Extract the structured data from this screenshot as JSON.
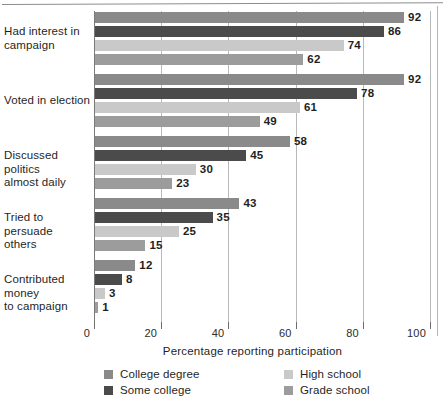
{
  "chart_data": {
    "type": "bar",
    "orientation": "horizontal",
    "title": "",
    "xlabel": "Percentage reporting participation",
    "ylabel": "",
    "xlim": [
      0,
      100
    ],
    "xticks": [
      0,
      20,
      40,
      60,
      80,
      100
    ],
    "xtick_labels": [
      "0",
      "20",
      "40",
      "60",
      "80",
      "100"
    ],
    "grid": true,
    "legend_position": "bottom",
    "categories": [
      "Had interest in campaign",
      "Voted in election",
      "Discussed politics almost daily",
      "Tried to persuade others",
      "Contributed money to campaign"
    ],
    "category_lines": [
      [
        "Had interest in",
        "campaign"
      ],
      [
        "Voted in election"
      ],
      [
        "Discussed politics",
        "almost daily"
      ],
      [
        "Tried to persuade",
        "others"
      ],
      [
        "Contributed money",
        "to campaign"
      ]
    ],
    "series": [
      {
        "name": "College degree",
        "color": "#8a8a8a",
        "values": [
          92,
          92,
          58,
          43,
          12
        ]
      },
      {
        "name": "Some college",
        "color": "#4b4b4b",
        "values": [
          86,
          78,
          45,
          35,
          8
        ]
      },
      {
        "name": "High school",
        "color": "#c9c9c9",
        "values": [
          74,
          61,
          30,
          25,
          3
        ]
      },
      {
        "name": "Grade school",
        "color": "#9c9c9c",
        "values": [
          62,
          49,
          23,
          15,
          1
        ]
      }
    ]
  },
  "legend": {
    "entries": [
      {
        "label": "College degree",
        "color": "#8a8a8a"
      },
      {
        "label": "Some college",
        "color": "#4b4b4b"
      },
      {
        "label": "High school",
        "color": "#c9c9c9"
      },
      {
        "label": "Grade school",
        "color": "#9c9c9c"
      }
    ]
  },
  "axis": {
    "x_title": "Percentage reporting participation"
  }
}
